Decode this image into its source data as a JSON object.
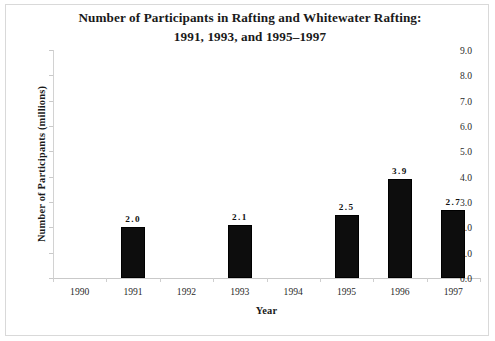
{
  "chart_data": {
    "type": "bar",
    "title": "Number of Participants in Rafting and Whitewater Rafting:",
    "subtitle": "1991, 1993, and 1995–1997",
    "xlabel": "Year",
    "ylabel": "Number of Participants (millions)",
    "categories": [
      "1990",
      "1991",
      "1992",
      "1993",
      "1994",
      "1995",
      "1996",
      "1997"
    ],
    "values": [
      null,
      2.0,
      null,
      2.1,
      null,
      2.5,
      3.9,
      2.7
    ],
    "data_labels": [
      "",
      "2.0",
      "",
      "2.1",
      "",
      "2.5",
      "3.9",
      "2.7"
    ],
    "ylim": [
      0.0,
      9.0
    ],
    "ytick_step": 1.0,
    "ytick_labels": [
      "9.0",
      "8.0",
      "7.0",
      "6.0",
      "5.0",
      "4.0",
      "3.0",
      "2.0",
      "1.0",
      "0.0"
    ],
    "ytick_values": [
      9.0,
      8.0,
      7.0,
      6.0,
      5.0,
      4.0,
      3.0,
      2.0,
      1.0,
      0.0
    ],
    "grid": false,
    "legend": null,
    "bar_color": "#0d0d0d",
    "axis_color": "#c9c9c9",
    "text_color": "#1a1a1a",
    "background": "#ffffff"
  }
}
